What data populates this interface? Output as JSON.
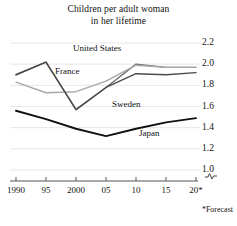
{
  "chart_data": {
    "type": "line",
    "title": "Children per adult woman in her lifetime",
    "title_line1": "Children per adult woman",
    "title_line2": "in her lifetime",
    "xlabel": "",
    "ylabel": "",
    "ylim": [
      1.0,
      2.2
    ],
    "ytick_values": [
      2.2,
      2.0,
      1.8,
      1.6,
      1.4,
      1.2,
      1.0
    ],
    "ytick_labels": [
      "2.2",
      "2.0",
      "1.8",
      "1.6",
      "1.4",
      "1.2",
      "1.0"
    ],
    "axis_break": true,
    "axis_break_symbol": "~",
    "xlim": [
      1990,
      2020
    ],
    "xtick_values": [
      1990,
      1995,
      2000,
      2005,
      2010,
      2015,
      2020
    ],
    "xtick_labels": [
      "1990",
      "95",
      "2000",
      "05",
      "10",
      "15",
      "20*"
    ],
    "grid": true,
    "grid_axis": "y",
    "legend_position": "inline-labels",
    "annotations": [
      "*Forecast"
    ],
    "footnote": "*Forecast",
    "x": [
      1990,
      1995,
      2000,
      2005,
      2010,
      2015,
      2020
    ],
    "series": [
      {
        "name": "United States",
        "color": "#6f6f6f",
        "width": 1.4,
        "label_x": 1999.5,
        "label_y": 2.14,
        "values": [
          1.9,
          2.02,
          1.57,
          1.78,
          2.0,
          1.97,
          1.97
        ]
      },
      {
        "name": "France",
        "color": "#a8a8a8",
        "width": 1.4,
        "label_x": 1996.5,
        "label_y": 1.93,
        "values": [
          1.83,
          1.73,
          1.74,
          1.84,
          1.99,
          1.97,
          1.97
        ]
      },
      {
        "name": "Sweden",
        "color": "#4a4a4a",
        "width": 1.4,
        "label_x": 2006.0,
        "label_y": 1.61,
        "values": [
          1.9,
          2.02,
          1.57,
          1.78,
          1.91,
          1.9,
          1.92
        ]
      },
      {
        "name": "Japan",
        "color": "#111111",
        "width": 1.9,
        "label_x": 2010.5,
        "label_y": 1.34,
        "values": [
          1.56,
          1.48,
          1.39,
          1.32,
          1.39,
          1.45,
          1.49
        ]
      }
    ]
  }
}
